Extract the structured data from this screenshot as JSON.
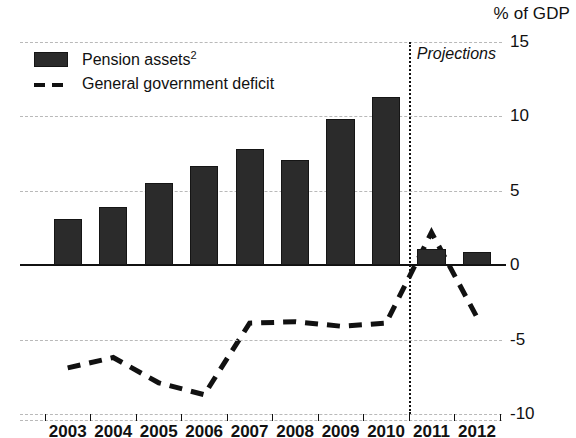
{
  "chart_data": {
    "type": "bar",
    "title": "",
    "subtitle": "",
    "unit_caption": "% of GDP",
    "xlabel": "",
    "ylabel": "",
    "ylim": [
      -10,
      15
    ],
    "yticks": [
      15,
      10,
      5,
      0,
      -5,
      -10
    ],
    "ytick_labels": [
      "15",
      "10",
      "5",
      "0",
      "-5",
      "-10"
    ],
    "grid": true,
    "grid_style": "dashed-horizontal",
    "legend_position": "top-left",
    "categories": [
      "2003",
      "2004",
      "2005",
      "2006",
      "2007",
      "2008",
      "2009",
      "2010",
      "2011",
      "2012"
    ],
    "series": [
      {
        "name": "Pension assets",
        "name_with_footnote": "Pension assets²",
        "footnote_marker": "2",
        "type": "bar",
        "color": "#2b2b2b",
        "values": [
          3.1,
          3.9,
          5.5,
          6.7,
          7.8,
          7.1,
          9.8,
          11.3,
          1.1,
          0.9
        ]
      },
      {
        "name": "General government deficit",
        "type": "line",
        "style": "dashed",
        "color": "#111111",
        "values": [
          -6.9,
          -6.2,
          -7.9,
          -8.7,
          -3.9,
          -3.8,
          -4.1,
          -3.9,
          2.2,
          -3.5
        ]
      }
    ],
    "annotations": [
      {
        "name": "projections-divider",
        "label": "Projections",
        "type": "vertical-line",
        "style": "dotted",
        "x_between": [
          "2010",
          "2011"
        ],
        "x_value": 2010.5
      }
    ]
  },
  "axis": {
    "unit_caption": "% of GDP",
    "y_labels": [
      "15",
      "10",
      "5",
      "0",
      "-5",
      "-10"
    ],
    "x_labels": [
      "2003",
      "2004",
      "2005",
      "2006",
      "2007",
      "2008",
      "2009",
      "2010",
      "2011",
      "2012"
    ]
  },
  "legend": {
    "items": [
      {
        "label": "Pension assets",
        "footnote": "2",
        "marker": "filled-square"
      },
      {
        "label": "General government deficit",
        "footnote": "",
        "marker": "dashed-line"
      }
    ]
  },
  "annotation": {
    "projections_label": "Projections"
  },
  "colors": {
    "bar_fill": "#2b2b2b",
    "bar_stroke": "#151515",
    "line": "#111111",
    "grid": "#b9b9b9",
    "axis": "#111111",
    "background": "#ffffff"
  }
}
